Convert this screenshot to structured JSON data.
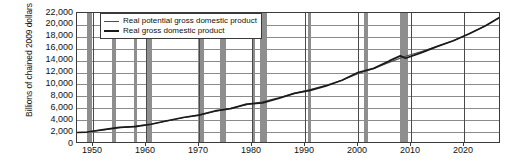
{
  "chart_data": {
    "type": "line",
    "title": "",
    "xlabel": "",
    "ylabel": "Billions of chained 2009 dollars",
    "xlim": [
      1947,
      2027
    ],
    "ylim": [
      0,
      22000
    ],
    "ytick_step": 2000,
    "yticks": [
      "22,000",
      "20,000",
      "18,000",
      "16,000",
      "14,000",
      "12,000",
      "10,000",
      "8,000",
      "6,000",
      "4,000",
      "2,000",
      "0"
    ],
    "ytick_values": [
      22000,
      20000,
      18000,
      16000,
      14000,
      12000,
      10000,
      8000,
      6000,
      4000,
      2000,
      0
    ],
    "xticks": [
      "1950",
      "1960",
      "1970",
      "1980",
      "1990",
      "2000",
      "2010",
      "2020"
    ],
    "xtick_values": [
      1950,
      1960,
      1970,
      1980,
      1990,
      2000,
      2010,
      2020
    ],
    "grid": true,
    "legend_position": "top-left",
    "series": [
      {
        "name": "Real potential gross domestic product",
        "color": "#4d4d4d",
        "x": [
          1949,
          1952,
          1955,
          1958,
          1961,
          1964,
          1967,
          1970,
          1973,
          1976,
          1979,
          1982,
          1985,
          1988,
          1991,
          1994,
          1997,
          2000,
          2003,
          2006,
          2009,
          2012,
          2015,
          2018,
          2021,
          2024,
          2027
        ],
        "values": [
          2050,
          2380,
          2720,
          3000,
          3350,
          3850,
          4400,
          4850,
          5450,
          6000,
          6600,
          7100,
          7750,
          8500,
          9150,
          9850,
          10700,
          11800,
          12700,
          13750,
          14750,
          15550,
          16400,
          17350,
          18500,
          19800,
          21400
        ]
      },
      {
        "name": "Real gross domestic product",
        "color": "#1a1a1a",
        "x": [
          1947,
          1949,
          1952,
          1955,
          1958,
          1961,
          1964,
          1967,
          1970,
          1973,
          1976,
          1979,
          1982,
          1985,
          1988,
          1991,
          1994,
          1997,
          2000,
          2003,
          2006,
          2008,
          2009,
          2012,
          2015,
          2018,
          2021,
          2024,
          2027
        ],
        "values": [
          1930,
          2010,
          2420,
          2780,
          2920,
          3320,
          3900,
          4450,
          4850,
          5550,
          5950,
          6700,
          6900,
          7650,
          8500,
          9000,
          9750,
          10700,
          12000,
          12700,
          14000,
          14800,
          14400,
          15350,
          16400,
          17350,
          18500,
          19800,
          21400
        ]
      }
    ],
    "recessions": [
      {
        "start": 1948.9,
        "end": 1949.8
      },
      {
        "start": 1953.6,
        "end": 1954.4
      },
      {
        "start": 1957.7,
        "end": 1958.4
      },
      {
        "start": 1960.3,
        "end": 1961.1
      },
      {
        "start": 1969.9,
        "end": 1970.9
      },
      {
        "start": 1973.9,
        "end": 1975.2
      },
      {
        "start": 1980.1,
        "end": 1980.6
      },
      {
        "start": 1981.6,
        "end": 1982.9
      },
      {
        "start": 1990.6,
        "end": 1991.2
      },
      {
        "start": 2001.2,
        "end": 2001.9
      },
      {
        "start": 2007.9,
        "end": 2009.5
      }
    ],
    "recession_color": "#8e8e8e"
  },
  "legend": {
    "items": [
      {
        "label": "Real potential gross domestic product"
      },
      {
        "label": "Real gross domestic product"
      }
    ]
  }
}
